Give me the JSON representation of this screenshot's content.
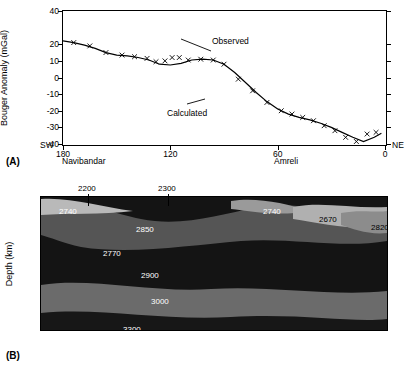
{
  "figure": {
    "panel_a_tag": "(A)",
    "panel_b_tag": "(B)"
  },
  "chart_data": [
    {
      "type": "line",
      "title": "",
      "panel": "(A)",
      "xlabel": "",
      "ylabel": "Bouger Anomaly (mGal)",
      "xlim": [
        180,
        0
      ],
      "ylim": [
        -40,
        40
      ],
      "xticks": [
        180,
        120,
        60,
        0
      ],
      "yticks": [
        40,
        20,
        10,
        0,
        -10,
        -20,
        -30,
        -40
      ],
      "ytick_labels": [
        "40",
        "20",
        "10",
        "0",
        "-10",
        "-20",
        "-30",
        "-40"
      ],
      "axis_end_labels": {
        "left": "SW",
        "right": "NE"
      },
      "place_labels": [
        {
          "text": "Navibandar",
          "x": 172
        },
        {
          "text": "Amreli",
          "x": 52
        }
      ],
      "annotations": [
        {
          "text": "Observed",
          "x": 108,
          "y": 22
        },
        {
          "text": "Calculated",
          "x": 118,
          "y": -22
        }
      ],
      "series": [
        {
          "name": "Calculated",
          "style": "line",
          "x": [
            180,
            174,
            168,
            162,
            156,
            150,
            144,
            138,
            132,
            126,
            120,
            114,
            108,
            102,
            96,
            90,
            84,
            78,
            72,
            66,
            60,
            54,
            48,
            42,
            36,
            30,
            24,
            18,
            12,
            6,
            2
          ],
          "y": [
            22,
            21,
            19.5,
            17.5,
            15,
            13.5,
            13,
            12,
            10.5,
            8,
            7.5,
            8.5,
            10.5,
            11,
            10.5,
            8,
            3,
            -3,
            -9,
            -14.5,
            -19,
            -22,
            -24,
            -25.5,
            -27.5,
            -30,
            -33,
            -36,
            -38.5,
            -36,
            -33.5
          ]
        },
        {
          "name": "Observed",
          "style": "x-markers",
          "x": [
            174,
            165,
            156,
            147,
            140,
            133,
            128,
            123,
            119,
            115,
            110,
            103,
            96,
            90,
            82,
            74,
            66,
            58,
            52,
            46,
            40,
            34,
            28,
            22,
            16,
            10,
            5
          ],
          "y": [
            21,
            19,
            15,
            13.5,
            12.5,
            11.5,
            9.5,
            10,
            12,
            12,
            10.5,
            11,
            10.5,
            8,
            -1,
            -8,
            -15,
            -20,
            -22,
            -24,
            -26,
            -29,
            -32,
            -36,
            -38.5,
            -34,
            -33
          ]
        }
      ]
    },
    {
      "type": "heatmap",
      "panel": "(B)",
      "title": "",
      "xlabel": "",
      "ylabel": "Depth (km)",
      "xlim": [
        180,
        0
      ],
      "ylim": [
        0,
        40
      ],
      "yticks": [
        0,
        10,
        20,
        30,
        40
      ],
      "ytick_labels": [
        "0",
        "10",
        "20",
        "30",
        "40"
      ],
      "description": "Crustal density model cross-section; labels are densities in kg/m3",
      "body_labels": [
        {
          "text": "2200",
          "x_px": 38,
          "y_px": -10,
          "leader": true
        },
        {
          "text": "2300",
          "x_px": 118,
          "y_px": -10,
          "leader": true
        },
        {
          "text": "2740",
          "x_px": 18,
          "y_px": 10,
          "color": "light"
        },
        {
          "text": "2850",
          "x_px": 95,
          "y_px": 28,
          "color": "light"
        },
        {
          "text": "2740",
          "x_px": 222,
          "y_px": 10,
          "color": "light"
        },
        {
          "text": "2670",
          "x_px": 278,
          "y_px": 18,
          "color": "dark"
        },
        {
          "text": "2820",
          "x_px": 330,
          "y_px": 26,
          "color": "dark"
        },
        {
          "text": "2770",
          "x_px": 62,
          "y_px": 52,
          "color": "light"
        },
        {
          "text": "2900",
          "x_px": 100,
          "y_px": 74,
          "color": "light"
        },
        {
          "text": "3000",
          "x_px": 110,
          "y_px": 100,
          "color": "light"
        },
        {
          "text": "3300",
          "x_px": 82,
          "y_px": 128,
          "color": "light"
        }
      ]
    }
  ]
}
